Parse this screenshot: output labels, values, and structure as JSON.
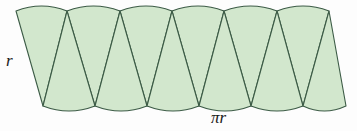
{
  "figure": {
    "name": "circle-dissection-parallelogram",
    "caption_labels": {
      "radius": "r",
      "base": "πr"
    },
    "colors": {
      "fill": "#d2e7cd",
      "stroke": "#3c5b46",
      "background": "#fdfdfd",
      "label_text": "#1a1a1a"
    },
    "geometry": {
      "sector_count": 12,
      "up_sectors": 6,
      "down_sectors": 6,
      "top_y": 11,
      "bottom_y": 106,
      "left_x": 16,
      "right_x": 346,
      "arc_bulge": 5,
      "stroke_width": 1.1,
      "shear_offset": 26,
      "top_cusps": [
        67,
        120,
        172,
        224,
        277,
        329
      ],
      "bottom_cusps": [
        43,
        95,
        147,
        199,
        251,
        303
      ],
      "top_nodes": [
        16,
        67,
        120,
        172,
        224,
        277,
        329
      ],
      "bottom_nodes": [
        43,
        95,
        147,
        199,
        251,
        303,
        346
      ]
    }
  }
}
